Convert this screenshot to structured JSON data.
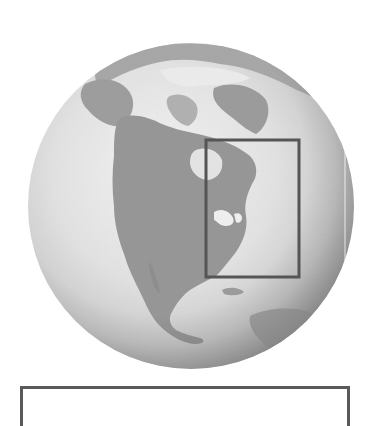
{
  "map": {
    "subject": "North America globe view",
    "style": "grayscale relief",
    "globe": {
      "cx": 191,
      "cy": 206,
      "r": 163
    },
    "highlight_region": {
      "label": "Northeastern North America",
      "x": 206,
      "y": 140,
      "width": 93,
      "height": 137,
      "stroke_color": "#555555"
    },
    "colors": {
      "ocean_light": "#f2f2f2",
      "ocean_mid": "#d8d8d8",
      "ocean_dark": "#b8b8b8",
      "land": "#9a9a9a",
      "land_dark": "#7e7e7e",
      "ice": "#e6e6e6",
      "frame": "#5a5a5a"
    }
  },
  "caption": {
    "text": ""
  }
}
